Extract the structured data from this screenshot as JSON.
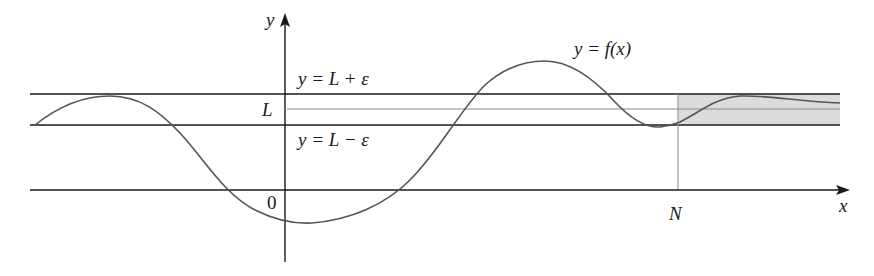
{
  "figure": {
    "colors": {
      "axis": "#1a1a1a",
      "curve": "#555555",
      "band_line": "#1a1a1a",
      "center_line": "#8a8a8a",
      "shade": "#dcdcdc",
      "n_line": "#9a9a9a"
    }
  },
  "labels": {
    "y_axis": "y",
    "x_axis": "x",
    "origin": "0",
    "L": "L",
    "N": "N",
    "upper_line": "y = L + ε",
    "lower_line": "y = L − ε",
    "curve": "y = f(x)"
  },
  "geometry": {
    "x_axis_y": 190,
    "y_axis_x": 285,
    "upper_y": 94,
    "center_y": 109,
    "lower_y": 125,
    "N_x": 678,
    "band_left": 30,
    "band_right": 840
  }
}
